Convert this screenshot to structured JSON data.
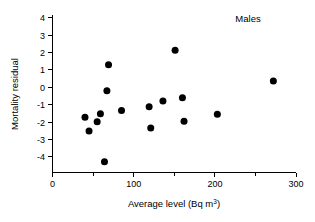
{
  "chart_data": {
    "type": "scatter",
    "title": "",
    "annotation": "Males",
    "xlabel_parts": {
      "main": "Average level (Bq m",
      "sup": "3",
      "tail": ")"
    },
    "xlabel": "Average level (Bq m3)",
    "ylabel": "Mortality residual",
    "xlim": [
      0,
      300
    ],
    "ylim": [
      -4.6,
      4
    ],
    "xticks": [
      0,
      100,
      200,
      300
    ],
    "xticklabels": [
      "0",
      "100",
      "200",
      "300"
    ],
    "xticks_minor": [
      50,
      150,
      250
    ],
    "yticks": [
      -4,
      -3,
      -2,
      -1,
      0,
      1,
      2,
      3,
      4
    ],
    "yticklabels": [
      "-4",
      "-3",
      "-2",
      "-1",
      "0",
      "1",
      "2",
      "3",
      "4"
    ],
    "grid": false,
    "legend": "none",
    "marker": "filled-circle",
    "marker_color": "#000000",
    "marker_size_px": 4.6,
    "x": [
      40,
      45,
      55,
      59,
      64,
      67,
      69,
      85,
      119,
      121,
      136,
      151,
      160,
      162,
      203,
      272
    ],
    "y": [
      -1.72,
      -2.52,
      -1.98,
      -1.53,
      -4.28,
      -0.2,
      1.29,
      -1.34,
      -1.12,
      -2.35,
      -0.8,
      2.12,
      -0.6,
      -1.95,
      -1.56,
      0.35
    ],
    "points": [
      {
        "x": 40,
        "y": -1.72
      },
      {
        "x": 45,
        "y": -2.52
      },
      {
        "x": 55,
        "y": -1.98
      },
      {
        "x": 59,
        "y": -1.53
      },
      {
        "x": 64,
        "y": -4.28
      },
      {
        "x": 67,
        "y": -0.2
      },
      {
        "x": 69,
        "y": 1.29
      },
      {
        "x": 85,
        "y": -1.34
      },
      {
        "x": 119,
        "y": -1.12
      },
      {
        "x": 121,
        "y": -2.35
      },
      {
        "x": 136,
        "y": -0.8
      },
      {
        "x": 151,
        "y": 2.12
      },
      {
        "x": 160,
        "y": -0.6
      },
      {
        "x": 162,
        "y": -1.95
      },
      {
        "x": 203,
        "y": -1.56
      },
      {
        "x": 272,
        "y": 0.35
      }
    ],
    "n_points": 16
  }
}
